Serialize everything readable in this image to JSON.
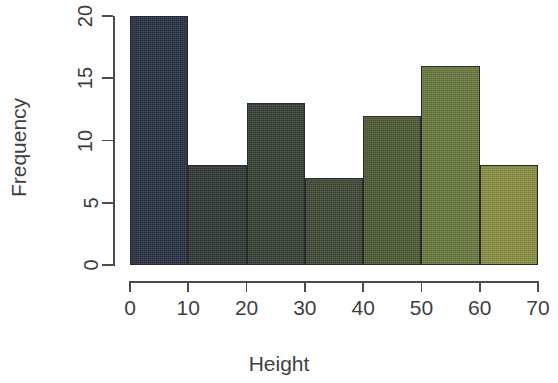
{
  "chart_data": {
    "type": "bar",
    "title": "",
    "subtitle": "",
    "xlabel": "Height",
    "ylabel": "Frequency",
    "categories": [
      "0-10",
      "10-20",
      "20-30",
      "30-40",
      "40-50",
      "50-60",
      "60-70"
    ],
    "bin_starts": [
      0,
      10,
      20,
      30,
      40,
      50,
      60
    ],
    "bin_width": 10,
    "values": [
      20,
      8,
      13,
      7,
      12,
      16,
      8
    ],
    "bar_colors": [
      "#2a3345",
      "#333c38",
      "#384238",
      "#414b38",
      "#4f5c37",
      "#6b7a40",
      "#8a8f45"
    ],
    "bar_border_color": "#2b2b2b",
    "xlim": [
      0,
      70
    ],
    "ylim": [
      0,
      20
    ],
    "x_ticks": [
      0,
      10,
      20,
      30,
      40,
      50,
      60,
      70
    ],
    "x_tick_labels": [
      "0",
      "10",
      "20",
      "30",
      "40",
      "50",
      "60",
      "70"
    ],
    "y_ticks": [
      0,
      5,
      10,
      15,
      20
    ],
    "y_tick_labels": [
      "0",
      "5",
      "10",
      "15",
      "20"
    ],
    "grid": false,
    "legend": null,
    "axis_color": "#4c4c4c",
    "background": "#ffffff",
    "y_tick_label_rotation": -90
  }
}
